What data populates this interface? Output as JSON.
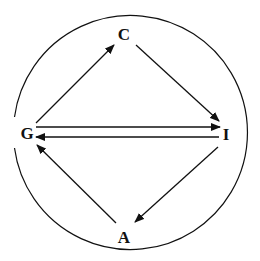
{
  "diagram": {
    "nodes": [
      {
        "id": "C",
        "label": "C",
        "x": 124,
        "y": 34
      },
      {
        "id": "I",
        "label": "I",
        "x": 225,
        "y": 139
      },
      {
        "id": "G",
        "label": "G",
        "x": 28,
        "y": 135
      },
      {
        "id": "A",
        "label": "A",
        "x": 124,
        "y": 238
      }
    ],
    "edges": [
      {
        "from": "G",
        "to": "C"
      },
      {
        "from": "C",
        "to": "I"
      },
      {
        "from": "G",
        "to": "I"
      },
      {
        "from": "I",
        "to": "G"
      },
      {
        "from": "I",
        "to": "A"
      },
      {
        "from": "A",
        "to": "G"
      }
    ],
    "enclosing_circle": {
      "cx": 130,
      "cy": 133,
      "r": 117,
      "gap_side": "left"
    },
    "colors": {
      "stroke": "#111111",
      "background": "#ffffff"
    }
  }
}
